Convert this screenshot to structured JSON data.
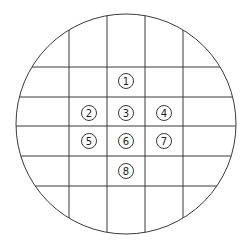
{
  "diagram": {
    "type": "sampling-grid-on-circular-plate",
    "colors": {
      "line": "#3a3a3a",
      "background": "#ffffff",
      "marker_stroke": "#3a3a3a",
      "marker_text": "#222222"
    },
    "circle": {
      "cx": 126,
      "cy": 124,
      "r": 110
    },
    "grid": {
      "vertical_x": [
        69,
        107,
        145,
        183
      ],
      "horizontal_y": [
        67,
        97,
        126,
        156,
        186
      ]
    },
    "markers": [
      {
        "label": "1",
        "cx": 126,
        "cy": 81
      },
      {
        "label": "2",
        "cx": 89,
        "cy": 113
      },
      {
        "label": "3",
        "cx": 126,
        "cy": 113
      },
      {
        "label": "4",
        "cx": 164,
        "cy": 113
      },
      {
        "label": "5",
        "cx": 89,
        "cy": 141
      },
      {
        "label": "6",
        "cx": 126,
        "cy": 141
      },
      {
        "label": "7",
        "cx": 164,
        "cy": 141
      },
      {
        "label": "8",
        "cx": 126,
        "cy": 171
      }
    ]
  }
}
